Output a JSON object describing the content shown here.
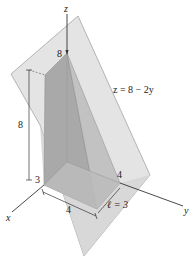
{
  "figure": {
    "plane_equation": "z = 8 − 2y",
    "axes": {
      "x_label": "x",
      "y_label": "y",
      "z_label": "z"
    },
    "labels": {
      "z_top": "8",
      "height": "8",
      "x_extent": "3",
      "base_width": "4",
      "y_extent": "4",
      "length": "ℓ = 3"
    },
    "colors": {
      "plane_fill": "#dcdcdc",
      "plane_edge": "#9a9a9a",
      "solid_dark": "#a6a6a6",
      "solid_mid": "#bdbdbd",
      "solid_light": "#cfcfcf",
      "axis": "#333333",
      "background": "#ffffff"
    }
  }
}
